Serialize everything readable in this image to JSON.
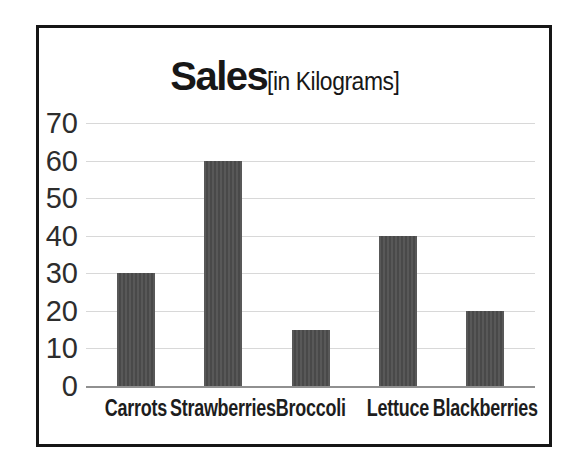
{
  "chart_data": {
    "type": "bar",
    "title": "Sales",
    "title_suffix": "[in Kilograms]",
    "categories": [
      "Carrots",
      "Strawberries",
      "Broccoli",
      "Lettuce",
      "Blackberries"
    ],
    "values": [
      30,
      60,
      15,
      40,
      20
    ],
    "xlabel": "",
    "ylabel": "",
    "ylim": [
      0,
      70
    ],
    "yticks": [
      70,
      60,
      50,
      40,
      30,
      20,
      10,
      0
    ],
    "grid": true,
    "legend": false,
    "bar_color": "#585858",
    "bar_stripe_color": "#494949",
    "gridline_color": "#d8d8d8",
    "axis_line_color": "#909090",
    "text_color": "#1d1d1d",
    "frame_border_color": "#161616"
  }
}
